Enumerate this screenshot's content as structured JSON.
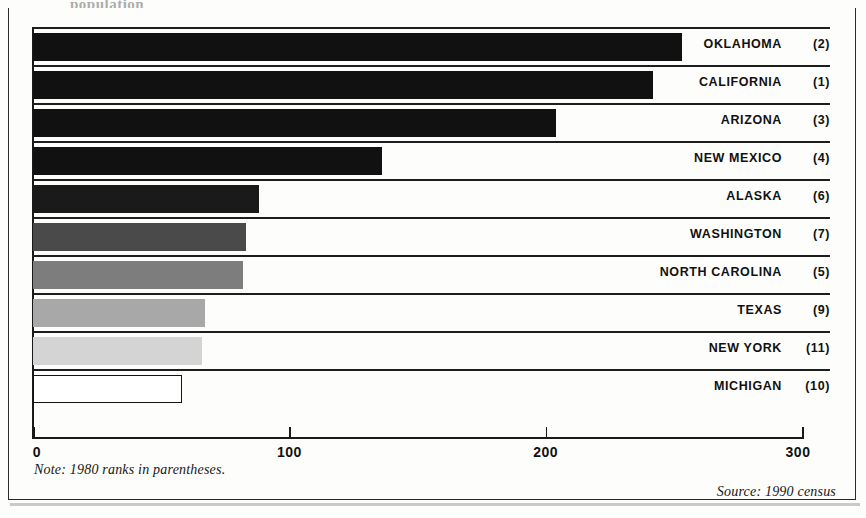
{
  "page": {
    "title_fragment": "population"
  },
  "chart_data": {
    "type": "bar",
    "orientation": "horizontal",
    "title": "",
    "xlabel": "",
    "ylabel": "",
    "xlim": [
      0,
      300
    ],
    "xticks": [
      0,
      100,
      200,
      300
    ],
    "xtick_labels": [
      "0",
      "100",
      "200",
      "300"
    ],
    "grid": false,
    "legend": "none",
    "categories": [
      "OKLAHOMA",
      "CALIFORNIA",
      "ARIZONA",
      "NEW MEXICO",
      "ALASKA",
      "WASHINGTON",
      "NORTH CAROLINA",
      "TEXAS",
      "NEW YORK",
      "MICHIGAN"
    ],
    "values": [
      253,
      242,
      204,
      136,
      88,
      83,
      82,
      67,
      66,
      58
    ],
    "annotations": [
      "(2)",
      "(1)",
      "(3)",
      "(4)",
      "(6)",
      "(7)",
      "(5)",
      "(9)",
      "(11)",
      "(10)"
    ],
    "bar_colors": [
      "#111111",
      "#111111",
      "#111111",
      "#111111",
      "#1a1a1a",
      "#4a4a4a",
      "#7d7d7d",
      "#a8a8a8",
      "#d4d4d4",
      "#ffffff"
    ],
    "bars": [
      {
        "label": "OKLAHOMA",
        "rank": "(2)",
        "value": 253,
        "color": "#111111",
        "outlined": false
      },
      {
        "label": "CALIFORNIA",
        "rank": "(1)",
        "value": 242,
        "color": "#111111",
        "outlined": false
      },
      {
        "label": "ARIZONA",
        "rank": "(3)",
        "value": 204,
        "color": "#111111",
        "outlined": false
      },
      {
        "label": "NEW MEXICO",
        "rank": "(4)",
        "value": 136,
        "color": "#111111",
        "outlined": false
      },
      {
        "label": "ALASKA",
        "rank": "(6)",
        "value": 88,
        "color": "#1a1a1a",
        "outlined": false
      },
      {
        "label": "WASHINGTON",
        "rank": "(7)",
        "value": 83,
        "color": "#4a4a4a",
        "outlined": false
      },
      {
        "label": "NORTH CAROLINA",
        "rank": "(5)",
        "value": 82,
        "color": "#7d7d7d",
        "outlined": false
      },
      {
        "label": "TEXAS",
        "rank": "(9)",
        "value": 67,
        "color": "#a8a8a8",
        "outlined": false
      },
      {
        "label": "NEW YORK",
        "rank": "(11)",
        "value": 66,
        "color": "#d4d4d4",
        "outlined": false
      },
      {
        "label": "MICHIGAN",
        "rank": "(10)",
        "value": 58,
        "color": "#ffffff",
        "outlined": true
      }
    ]
  },
  "footer": {
    "note": "Note: 1980 ranks in parentheses.",
    "source": "Source: 1990 census"
  }
}
